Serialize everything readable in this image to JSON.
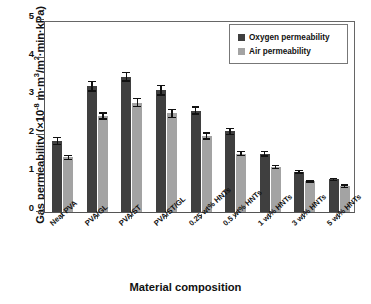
{
  "chart_data": {
    "type": "bar",
    "title": "",
    "xlabel": "Material composition",
    "ylabel": "Gas permeability (×10-8 m·m3/m2·min·kPa)",
    "ylim": [
      0,
      5
    ],
    "yticks": [
      0,
      1,
      2,
      3,
      4,
      5
    ],
    "ytick_labels": [
      "0",
      "1",
      "2",
      "3",
      "4",
      "5"
    ],
    "grid": false,
    "legend_position": "top-right",
    "categories": [
      "Neat PVA",
      "PVA/GL",
      "PVA/ST",
      "PVA/ST/GL",
      "0.25 wt% HNTs",
      "0.5 wt% HNTs",
      "1 wt% HNTs",
      "3 wt% HNTs",
      "5 wt% HNTs"
    ],
    "series": [
      {
        "name": "Oxygen permeability",
        "color": "#3f3f3f",
        "values": [
          1.85,
          3.27,
          3.52,
          3.17,
          2.64,
          2.1,
          1.52,
          1.05,
          0.85
        ],
        "errors": [
          0.11,
          0.14,
          0.13,
          0.14,
          0.11,
          0.1,
          0.08,
          0.05,
          0.04
        ]
      },
      {
        "name": "Air permeability",
        "color": "#a3a3a3",
        "values": [
          1.42,
          2.5,
          2.85,
          2.57,
          1.98,
          1.52,
          1.17,
          0.8,
          0.67
        ],
        "errors": [
          0.07,
          0.1,
          0.12,
          0.12,
          0.1,
          0.07,
          0.06,
          0.04,
          0.05
        ]
      }
    ]
  },
  "axis": {
    "y_title_prefix": "Gas permeability (×10",
    "y_title_exponent": "-8",
    "y_title_suffix_a": " m·m",
    "y_title_exp_a": "3",
    "y_title_suffix_b": "/m",
    "y_title_exp_b": "2",
    "y_title_suffix_c": "·min·kPa)",
    "x_title": "Material composition"
  },
  "legend": {
    "items": [
      {
        "label": "Oxygen permeability",
        "color": "#3f3f3f"
      },
      {
        "label": "Air permeability",
        "color": "#a3a3a3"
      }
    ]
  }
}
